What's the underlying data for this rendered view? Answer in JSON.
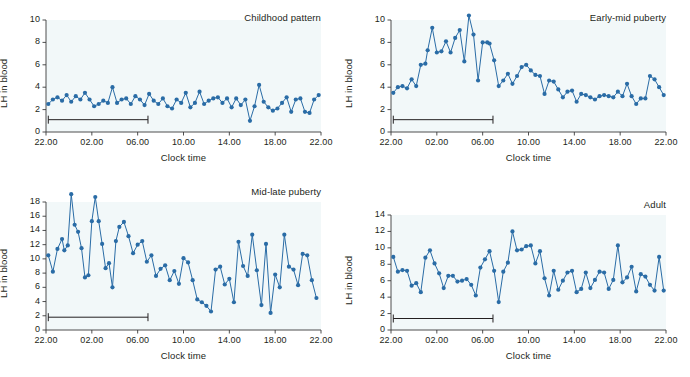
{
  "figure": {
    "background": "#ffffff",
    "series_color": "#2a6ca6",
    "axis_color": "#3b3b3b",
    "plot_bg": "#f2f8f9",
    "xlabel": "Clock time",
    "ylabel": "LH in blood",
    "sleep_label": "Sleep"
  },
  "chart_data": [
    {
      "type": "line",
      "title": "Childhood pattern",
      "xlabel": "Clock time",
      "ylabel": "LH in blood",
      "xlim": [
        0,
        24
      ],
      "ylim": [
        0,
        10
      ],
      "yticks": [
        0,
        2,
        4,
        6,
        8,
        10
      ],
      "xticks": [
        0,
        4,
        8,
        12,
        16,
        20,
        24
      ],
      "xticklabels": [
        "22.00",
        "02.00",
        "06.00",
        "10.00",
        "14.00",
        "18.00",
        "22.00"
      ],
      "grid": false,
      "legend": "none",
      "annotations": [
        {
          "text": "Sleep",
          "x_start": 0.2,
          "x_end": 8.9,
          "y": 1.1
        }
      ],
      "x": [
        0.2,
        0.6,
        1.0,
        1.4,
        1.8,
        2.2,
        2.6,
        3.0,
        3.4,
        3.8,
        4.2,
        4.6,
        5.0,
        5.4,
        5.8,
        6.2,
        6.6,
        7.0,
        7.4,
        7.8,
        8.2,
        8.6,
        9.0,
        9.4,
        9.8,
        10.2,
        10.6,
        11.0,
        11.4,
        11.8,
        12.2,
        12.6,
        13.0,
        13.4,
        13.8,
        14.2,
        14.6,
        15.0,
        15.4,
        15.8,
        16.2,
        16.6,
        17.0,
        17.4,
        17.8,
        18.2,
        18.6,
        19.0,
        19.4,
        19.8,
        20.2,
        20.6,
        21.0,
        21.4,
        21.8,
        22.2,
        22.6,
        23.0,
        23.4,
        23.8
      ],
      "y": [
        2.5,
        2.9,
        3.1,
        2.8,
        3.3,
        2.7,
        3.2,
        2.9,
        3.5,
        2.9,
        2.3,
        2.5,
        2.8,
        2.6,
        4.0,
        2.6,
        2.9,
        3.0,
        2.5,
        3.2,
        2.9,
        2.4,
        3.4,
        2.8,
        2.5,
        3.0,
        2.3,
        2.1,
        2.9,
        2.6,
        3.5,
        2.2,
        2.6,
        3.6,
        2.5,
        2.8,
        3.0,
        3.1,
        2.6,
        3.0,
        2.2,
        3.0,
        2.4,
        2.9,
        1.0,
        2.3,
        4.2,
        2.7,
        2.2,
        1.9,
        2.1,
        2.6,
        3.1,
        1.8,
        2.9,
        3.0,
        1.8,
        1.7,
        2.9,
        3.3
      ]
    },
    {
      "type": "line",
      "title": "Early-mid puberty",
      "xlabel": "Clock time",
      "ylabel": "LH in blood",
      "xlim": [
        0,
        24
      ],
      "ylim": [
        0,
        10
      ],
      "yticks": [
        0,
        2,
        4,
        6,
        8,
        10
      ],
      "xticks": [
        0,
        4,
        8,
        12,
        16,
        20,
        24
      ],
      "xticklabels": [
        "22.00",
        "02.00",
        "06.00",
        "10.00",
        "14.00",
        "18.00",
        "22.00"
      ],
      "grid": false,
      "legend": "none",
      "annotations": [
        {
          "text": "Sleep",
          "x_start": 0.2,
          "x_end": 8.9,
          "y": 1.1
        }
      ],
      "x": [
        0.2,
        0.6,
        1.0,
        1.4,
        1.8,
        2.2,
        2.6,
        3.0,
        3.2,
        3.6,
        4.0,
        4.4,
        4.8,
        5.2,
        5.6,
        6.0,
        6.4,
        6.8,
        7.2,
        7.6,
        8.0,
        8.4,
        8.6,
        9.0,
        9.4,
        9.8,
        10.2,
        10.6,
        11.0,
        11.4,
        11.8,
        12.2,
        12.6,
        13.0,
        13.4,
        13.8,
        14.2,
        14.6,
        15.0,
        15.4,
        15.8,
        16.2,
        16.6,
        17.0,
        17.4,
        17.8,
        18.2,
        18.6,
        19.0,
        19.4,
        19.8,
        20.2,
        20.6,
        21.0,
        21.4,
        21.8,
        22.2,
        22.6,
        23.0,
        23.4,
        23.8
      ],
      "y": [
        3.5,
        4.0,
        4.1,
        3.9,
        4.7,
        4.1,
        6.0,
        6.1,
        7.3,
        9.3,
        7.1,
        7.2,
        8.1,
        7.1,
        8.4,
        9.1,
        6.3,
        10.4,
        8.7,
        4.6,
        8.0,
        8.0,
        7.9,
        6.4,
        4.1,
        4.6,
        5.2,
        4.3,
        5.0,
        5.8,
        6.0,
        5.5,
        5.1,
        5.0,
        3.4,
        4.6,
        4.5,
        3.8,
        3.1,
        3.6,
        3.7,
        2.7,
        3.4,
        3.3,
        3.1,
        2.9,
        3.2,
        3.3,
        3.2,
        3.1,
        3.6,
        3.2,
        4.3,
        3.2,
        2.5,
        3.0,
        3.0,
        5.0,
        4.7,
        4.0,
        3.3
      ]
    },
    {
      "type": "line",
      "title": "Mid-late puberty",
      "xlabel": "Clock time",
      "ylabel": "LH in blood",
      "xlim": [
        0,
        24
      ],
      "ylim": [
        0,
        18
      ],
      "yticks": [
        0,
        2,
        4,
        6,
        8,
        10,
        12,
        14,
        16,
        18
      ],
      "xticks": [
        0,
        4,
        8,
        12,
        16,
        20,
        24
      ],
      "xticklabels": [
        "22.00",
        "02.00",
        "06.00",
        "10.00",
        "14.00",
        "18.00",
        "22.00"
      ],
      "grid": false,
      "legend": "none",
      "annotations": [
        {
          "text": "Sleep",
          "x_start": 0.2,
          "x_end": 8.9,
          "y": 1.8
        }
      ],
      "x": [
        0.2,
        0.6,
        1.0,
        1.4,
        1.6,
        1.9,
        2.2,
        2.5,
        2.8,
        3.1,
        3.4,
        3.7,
        4.0,
        4.3,
        4.6,
        4.9,
        5.2,
        5.5,
        5.8,
        6.1,
        6.4,
        6.8,
        7.2,
        7.6,
        8.0,
        8.4,
        8.8,
        9.2,
        9.6,
        10.0,
        10.4,
        10.8,
        11.2,
        11.6,
        12.0,
        12.4,
        12.8,
        13.2,
        13.6,
        14.0,
        14.4,
        14.8,
        15.2,
        15.6,
        16.0,
        16.4,
        16.8,
        17.2,
        17.6,
        18.0,
        18.4,
        18.8,
        19.2,
        19.6,
        20.0,
        20.4,
        20.8,
        21.2,
        21.6,
        22.0,
        22.4,
        22.8,
        23.2,
        23.6
      ],
      "y": [
        10.5,
        8.2,
        11.4,
        12.8,
        11.2,
        11.9,
        19.1,
        14.8,
        13.8,
        11.5,
        7.4,
        7.7,
        15.3,
        18.7,
        15.3,
        12.1,
        8.7,
        9.4,
        6.0,
        12.5,
        14.5,
        15.2,
        13.2,
        10.8,
        12.0,
        12.5,
        9.6,
        10.5,
        7.6,
        8.6,
        9.1,
        7.0,
        8.3,
        6.5,
        10.1,
        9.5,
        7.0,
        4.3,
        3.9,
        3.4,
        2.6,
        8.5,
        8.9,
        6.4,
        7.2,
        3.9,
        12.4,
        9.0,
        7.6,
        13.4,
        8.4,
        3.5,
        12.1,
        2.4,
        7.8,
        6.0,
        13.4,
        8.9,
        8.5,
        6.3,
        10.7,
        10.5,
        7.0,
        4.5
      ]
    },
    {
      "type": "line",
      "title": "Adult",
      "xlabel": "Clock time",
      "ylabel": "LH in blood",
      "xlim": [
        0,
        24
      ],
      "ylim": [
        0,
        14
      ],
      "yticks": [
        0,
        2,
        4,
        6,
        8,
        10,
        12,
        14
      ],
      "xticks": [
        0,
        4,
        8,
        12,
        16,
        20,
        24
      ],
      "xticklabels": [
        "22.00",
        "02.00",
        "06.00",
        "10.00",
        "14.00",
        "18.00",
        "22.00"
      ],
      "grid": false,
      "legend": "none",
      "annotations": [
        {
          "text": "Sleep",
          "x_start": 0.2,
          "x_end": 8.9,
          "y": 1.4
        }
      ],
      "x": [
        0.2,
        0.6,
        1.0,
        1.4,
        1.8,
        2.2,
        2.6,
        3.0,
        3.4,
        3.8,
        4.2,
        4.6,
        5.0,
        5.4,
        5.8,
        6.2,
        6.6,
        7.0,
        7.4,
        7.8,
        8.2,
        8.6,
        9.0,
        9.4,
        9.8,
        10.2,
        10.6,
        11.0,
        11.4,
        11.8,
        12.2,
        12.6,
        13.0,
        13.4,
        13.8,
        14.2,
        14.6,
        15.0,
        15.4,
        15.8,
        16.2,
        16.6,
        17.0,
        17.4,
        17.8,
        18.2,
        18.6,
        19.0,
        19.4,
        19.8,
        20.2,
        20.6,
        21.0,
        21.4,
        21.8,
        22.2,
        22.6,
        23.0,
        23.4,
        23.8
      ],
      "y": [
        8.9,
        7.1,
        7.3,
        7.2,
        5.4,
        5.7,
        4.6,
        8.8,
        9.7,
        8.1,
        6.9,
        5.1,
        6.6,
        6.6,
        5.9,
        6.0,
        6.2,
        5.5,
        4.2,
        7.6,
        8.6,
        9.6,
        7.2,
        3.4,
        7.1,
        8.2,
        12.0,
        9.7,
        9.8,
        10.2,
        10.3,
        8.1,
        9.6,
        6.3,
        4.2,
        7.2,
        4.9,
        6.0,
        7.0,
        7.2,
        4.6,
        5.0,
        7.0,
        5.1,
        6.1,
        7.1,
        7.0,
        5.0,
        6.1,
        10.3,
        5.8,
        6.4,
        7.7,
        4.7,
        6.8,
        6.5,
        5.5,
        4.8,
        8.9,
        4.8
      ]
    }
  ]
}
